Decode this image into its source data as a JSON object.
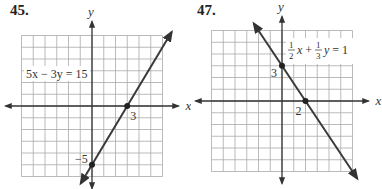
{
  "chart_data": [
    {
      "type": "line",
      "problem_number": "45.",
      "equation": "5x − 3y = 15",
      "xlabel": "x",
      "ylabel": "y",
      "xlim": [
        -6,
        6
      ],
      "ylim": [
        -6,
        6
      ],
      "grid": true,
      "points": [
        {
          "x": 3,
          "y": 0,
          "label": "3"
        },
        {
          "x": 0,
          "y": -5,
          "label": "−5"
        }
      ],
      "line": {
        "slope": 1.6667,
        "intercept": -5
      },
      "color": "#3a3a3a"
    },
    {
      "type": "line",
      "problem_number": "47.",
      "equation": "½x + ⅓y = 1",
      "equation_parts": {
        "a_num": "1",
        "a_den": "2",
        "b_num": "1",
        "b_den": "3",
        "rhs": "1"
      },
      "xlabel": "x",
      "ylabel": "y",
      "xlim": [
        -6,
        6
      ],
      "ylim": [
        -6,
        6
      ],
      "grid": true,
      "points": [
        {
          "x": 0,
          "y": 3,
          "label": "3"
        },
        {
          "x": 2,
          "y": 0,
          "label": "2"
        }
      ],
      "line": {
        "slope": -1.5,
        "intercept": 3
      },
      "color": "#3a3a3a"
    }
  ]
}
